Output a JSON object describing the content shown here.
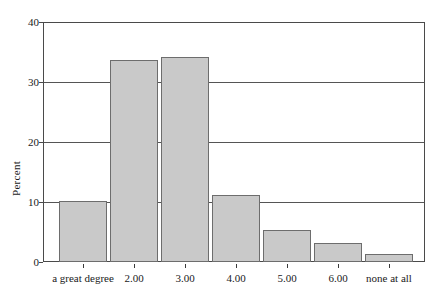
{
  "chart_data": {
    "type": "bar",
    "title": "",
    "subtitle": "",
    "xlabel": "",
    "ylabel": "Percent",
    "categories": [
      "a great degree",
      "2.00",
      "3.00",
      "4.00",
      "5.00",
      "6.00",
      "none at all"
    ],
    "values": [
      10.2,
      33.7,
      34.2,
      11.2,
      5.3,
      3.2,
      1.3
    ],
    "ylim": [
      0,
      40
    ],
    "y_ticks": [
      0,
      10,
      20,
      30,
      40
    ],
    "y_tick_labels": [
      "0",
      "10",
      "20",
      "30",
      "40"
    ],
    "grid": "horizontal",
    "legend": "none",
    "bar_fill_color": "#c9c9c9",
    "bar_border_color": "#6d6d6d",
    "axis_color": "#4a4a4a",
    "gridline_color": "#555555",
    "background_color": "#ffffff"
  }
}
